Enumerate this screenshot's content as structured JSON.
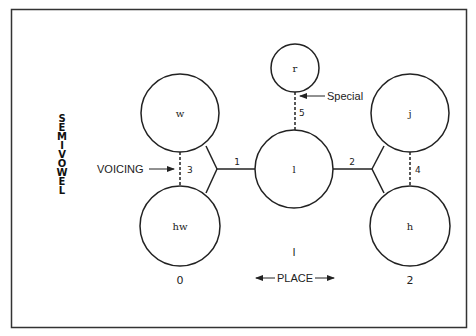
{
  "diagram": {
    "side_label": "SEMIVOWEL",
    "nodes": [
      {
        "id": "w",
        "label": "w",
        "cx": 180,
        "cy": 113,
        "r": 39
      },
      {
        "id": "hw",
        "label": "hw",
        "cx": 180,
        "cy": 226,
        "r": 40
      },
      {
        "id": "l",
        "label": "l",
        "cx": 294,
        "cy": 169,
        "r": 39
      },
      {
        "id": "r",
        "label": "r",
        "cx": 295,
        "cy": 68,
        "r": 24
      },
      {
        "id": "j",
        "label": "j",
        "cx": 410,
        "cy": 113,
        "r": 39
      },
      {
        "id": "h",
        "label": "h",
        "cx": 410,
        "cy": 226,
        "r": 40
      }
    ],
    "edges": [
      {
        "id": "edge-1",
        "label": "1",
        "from": "w/hw",
        "to": "l",
        "style": "solid"
      },
      {
        "id": "edge-2",
        "label": "2",
        "from": "l",
        "to": "j/h",
        "style": "solid"
      },
      {
        "id": "edge-3",
        "label": "3",
        "from": "w",
        "to": "hw",
        "style": "dashed"
      },
      {
        "id": "edge-4",
        "label": "4",
        "from": "j",
        "to": "h",
        "style": "dashed"
      },
      {
        "id": "edge-5",
        "label": "5",
        "from": "r",
        "to": "l",
        "style": "dashed"
      }
    ],
    "annotations": {
      "voicing": "VOICING",
      "special": "Special",
      "place": "PLACE"
    },
    "place_axis": {
      "left_value": "0",
      "center_value": "l",
      "right_value": "2"
    }
  }
}
